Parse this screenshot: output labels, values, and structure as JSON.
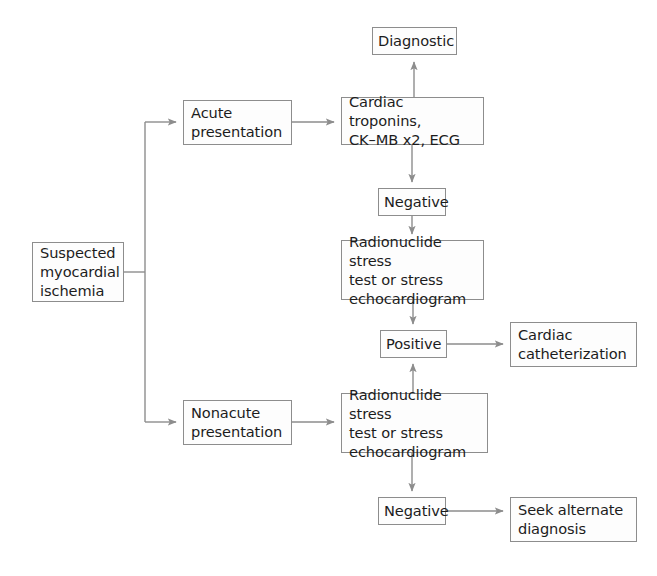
{
  "figure": {
    "type": "flowchart",
    "caption_fragment": "",
    "colors": {
      "box_border": "#8d8d8d",
      "box_fill": "#fdfdfd",
      "connector": "#8d8d8d",
      "text": "#1c1c1c",
      "background": "#ffffff"
    }
  },
  "nodes": [
    {
      "id": "start",
      "label": "Suspected\nmyocardial\nischemia",
      "x": 32,
      "y": 242,
      "w": 92,
      "h": 60,
      "align": "left"
    },
    {
      "id": "acute",
      "label": "Acute\npresentation",
      "x": 183,
      "y": 100,
      "w": 109,
      "h": 45,
      "align": "left"
    },
    {
      "id": "nonacute",
      "label": "Nonacute\npresentation",
      "x": 183,
      "y": 400,
      "w": 109,
      "h": 45,
      "align": "left"
    },
    {
      "id": "troponins",
      "label": "Cardiac troponins,\nCK–MB x2, ECG",
      "x": 341,
      "y": 97,
      "w": 143,
      "h": 48,
      "align": "left"
    },
    {
      "id": "diagnostic",
      "label": "Diagnostic",
      "x": 372,
      "y": 27,
      "w": 85,
      "h": 28,
      "align": "center"
    },
    {
      "id": "neg1",
      "label": "Negative",
      "x": 378,
      "y": 188,
      "w": 68,
      "h": 28,
      "align": "center"
    },
    {
      "id": "stress1",
      "label": "Radionuclide stress\ntest or stress\nechocardiogram",
      "x": 341,
      "y": 240,
      "w": 143,
      "h": 60,
      "align": "left"
    },
    {
      "id": "positive",
      "label": "Positive",
      "x": 380,
      "y": 330,
      "w": 67,
      "h": 28,
      "align": "center"
    },
    {
      "id": "cath",
      "label": "Cardiac\ncatheterization",
      "x": 510,
      "y": 322,
      "w": 127,
      "h": 45,
      "align": "left"
    },
    {
      "id": "stress2",
      "label": "Radionuclide stress\ntest or stress\nechocardiogram",
      "x": 341,
      "y": 393,
      "w": 147,
      "h": 60,
      "align": "left"
    },
    {
      "id": "neg2",
      "label": "Negative",
      "x": 378,
      "y": 497,
      "w": 68,
      "h": 28,
      "align": "center"
    },
    {
      "id": "seek",
      "label": "Seek alternate\ndiagnosis",
      "x": 510,
      "y": 497,
      "w": 127,
      "h": 45,
      "align": "left"
    }
  ],
  "edges": [
    {
      "id": "start-split",
      "from": "start",
      "to": "branch-point",
      "arrow": false,
      "label": ""
    },
    {
      "id": "branch-acute",
      "from": "branch",
      "to": "acute",
      "arrow": true,
      "label": ""
    },
    {
      "id": "branch-nonacute",
      "from": "branch",
      "to": "nonacute",
      "arrow": true,
      "label": ""
    },
    {
      "id": "acute-troponins",
      "from": "acute",
      "to": "troponins",
      "arrow": true,
      "label": ""
    },
    {
      "id": "troponins-diag",
      "from": "troponins",
      "to": "diagnostic",
      "arrow": true,
      "label": ""
    },
    {
      "id": "troponins-neg1",
      "from": "troponins",
      "to": "neg1",
      "arrow": true,
      "label": ""
    },
    {
      "id": "neg1-stress1",
      "from": "neg1",
      "to": "stress1",
      "arrow": true,
      "label": ""
    },
    {
      "id": "stress1-positive",
      "from": "stress1",
      "to": "positive",
      "arrow": true,
      "label": ""
    },
    {
      "id": "positive-cath",
      "from": "positive",
      "to": "cath",
      "arrow": true,
      "label": ""
    },
    {
      "id": "nonacute-stress2",
      "from": "nonacute",
      "to": "stress2",
      "arrow": true,
      "label": ""
    },
    {
      "id": "stress2-positive",
      "from": "stress2",
      "to": "positive",
      "arrow": true,
      "label": ""
    },
    {
      "id": "stress2-neg2",
      "from": "stress2",
      "to": "neg2",
      "arrow": true,
      "label": ""
    },
    {
      "id": "neg2-seek",
      "from": "neg2",
      "to": "seek",
      "arrow": true,
      "label": ""
    }
  ]
}
